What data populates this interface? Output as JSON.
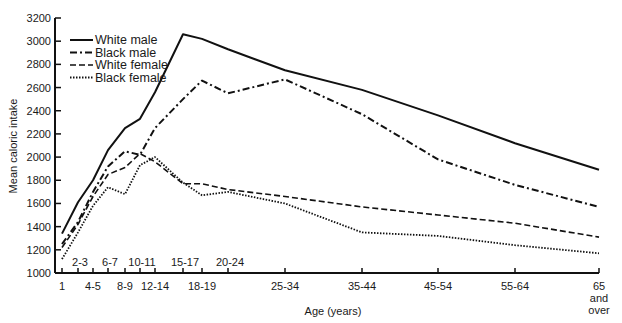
{
  "chart_data": {
    "type": "line",
    "title": "",
    "xlabel": "Age (years)",
    "ylabel": "Mean caloric intake",
    "ylim": [
      1000,
      3200
    ],
    "yticks": [
      1000,
      1200,
      1400,
      1600,
      1800,
      2000,
      2200,
      2400,
      2600,
      2800,
      3000,
      3200
    ],
    "categories": [
      "1",
      "2-3",
      "4-5",
      "6-7",
      "8-9",
      "10-11",
      "12-14",
      "15-17",
      "18-19",
      "20-24",
      "25-34",
      "35-44",
      "45-54",
      "55-64",
      "65 and over"
    ],
    "category_label_rows": {
      "upper": [
        "2-3",
        "6-7",
        "10-11",
        "15-17",
        "20-24"
      ],
      "lower": [
        "1",
        "4-5",
        "8-9",
        "12-14",
        "18-19",
        "25-34",
        "35-44",
        "45-54",
        "55-64",
        "65 and over"
      ]
    },
    "grid": false,
    "legend_position": "upper-left",
    "series": [
      {
        "name": "White male",
        "style": "solid",
        "values": [
          1340,
          1610,
          1800,
          2060,
          2250,
          2330,
          2560,
          3060,
          3020,
          2930,
          2750,
          2580,
          2360,
          2120,
          1890
        ]
      },
      {
        "name": "Black male",
        "style": "dash-dot",
        "values": [
          1250,
          1440,
          1700,
          1920,
          2050,
          2020,
          2250,
          2500,
          2660,
          2550,
          2670,
          2370,
          1980,
          1760,
          1570
        ]
      },
      {
        "name": "White female",
        "style": "dashed",
        "values": [
          1220,
          1420,
          1660,
          1850,
          1910,
          2030,
          1960,
          1770,
          1770,
          1720,
          1660,
          1570,
          1500,
          1430,
          1310
        ]
      },
      {
        "name": "Black female",
        "style": "dotted",
        "values": [
          1120,
          1350,
          1580,
          1740,
          1680,
          1930,
          2000,
          1780,
          1670,
          1700,
          1600,
          1350,
          1320,
          1240,
          1170
        ]
      }
    ]
  },
  "legend": {
    "items": [
      "White male",
      "Black male",
      "White female",
      "Black female"
    ]
  },
  "axes": {
    "x_title": "Age (years)",
    "y_title": "Mean caloric intake",
    "last_tick_lines": [
      "65",
      "and",
      "over"
    ]
  }
}
